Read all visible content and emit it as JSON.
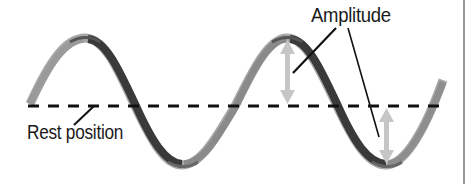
{
  "diagram": {
    "type": "transverse-wave",
    "labels": {
      "amplitude": "Amplitude",
      "rest_position": "Rest position"
    },
    "colors": {
      "wave_dark": "#3a3a3a",
      "wave_mid": "#7a7a7a",
      "wave_light": "#b5b5b5",
      "arrow": "#c8c8c8",
      "rest_line": "#111111",
      "leader_line": "#111111",
      "frame_border": "#9a9a9a",
      "background": "#ffffff"
    },
    "rest_line_y": 106,
    "crest_y": 38,
    "trough_y": 165,
    "amplitude_arrows": [
      {
        "x": 287,
        "from_y": 40,
        "to_y": 104,
        "position": "crest"
      },
      {
        "x": 386,
        "from_y": 108,
        "to_y": 163,
        "position": "trough"
      }
    ]
  }
}
